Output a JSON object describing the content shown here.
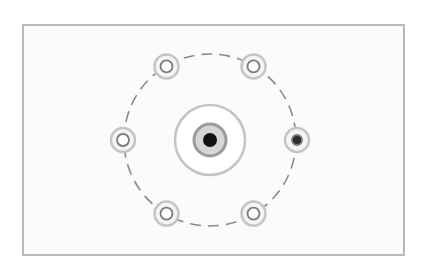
{
  "diagram": {
    "type": "hub-and-ring",
    "colors": {
      "background": "#ffffff",
      "frame": "#b8b8b8",
      "panel": "#fbfbfb",
      "ring": "#8a8a8a",
      "halo": "#c4c4c4",
      "node_stroke": "#7a7a7a",
      "node_fill_empty": "#ffffff",
      "node_fill_active": "#2e2e2e",
      "center_core": "#111111",
      "center_mid": "#9a9a9a"
    },
    "center_node": {
      "id": "center",
      "state": "active"
    },
    "satellites": [
      {
        "id": "top-left",
        "angle_deg": 240,
        "state": "empty"
      },
      {
        "id": "top-right",
        "angle_deg": 300,
        "state": "empty"
      },
      {
        "id": "right",
        "angle_deg": 0,
        "state": "active"
      },
      {
        "id": "bottom-right",
        "angle_deg": 60,
        "state": "empty"
      },
      {
        "id": "bottom-left",
        "angle_deg": 120,
        "state": "empty"
      },
      {
        "id": "left",
        "angle_deg": 180,
        "state": "empty"
      }
    ],
    "ring_style": "dashed"
  }
}
